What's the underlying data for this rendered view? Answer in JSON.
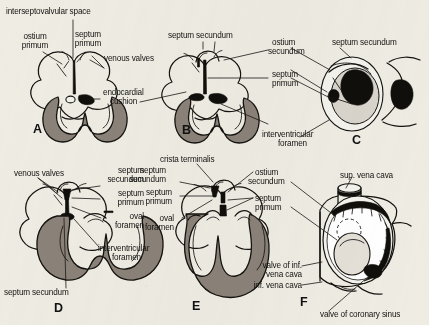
{
  "figure": {
    "background_color": "#efece4",
    "ink_color": "#111111",
    "myocardium_fill": "#8b8279",
    "panels": [
      {
        "letter": "A",
        "labels": [
          "interseptovalvular space",
          "ostium\nprimum",
          "septum\nprimum",
          "venous valves",
          "endocardial\ncushion"
        ]
      },
      {
        "letter": "B",
        "labels": [
          "septum secundum",
          "ostium\nsecundum",
          "septum\nprimum",
          "interventricular\nforamen"
        ]
      },
      {
        "letter": "C",
        "labels": [
          "septum secundum"
        ]
      },
      {
        "letter": "D",
        "labels": [
          "venous valves",
          "septum\nsecundum",
          "septum\nprimum",
          "oval\nforamen",
          "interventricular\nforamen",
          "septum secundum"
        ]
      },
      {
        "letter": "E",
        "labels": [
          "crista terminalis",
          "septum\nsecundum",
          "septum\nprimum",
          "oval\nforamen",
          "interventricular\nforamen",
          "ostium\nsecundum",
          "septum\nprimum"
        ]
      },
      {
        "letter": "F",
        "labels": [
          "sup. vena cava",
          "valve of inf.\nvena cava",
          "inf. vena cava",
          "valve of coronary sinus"
        ]
      }
    ]
  },
  "labels": {
    "interseptovalvular_space": "interseptovalvular space",
    "ostium_primum_l1": "ostium",
    "ostium_primum_l2": "primum",
    "septum_primum_a_l1": "septum",
    "septum_primum_a_l2": "primum",
    "venous_valves_a": "venous valves",
    "endocardial_l1": "endocardial",
    "endocardial_l2": "cushion",
    "letter_a": "A",
    "septum_secundum_b": "septum secundum",
    "ostium_secundum_b_l1": "ostium",
    "ostium_secundum_b_l2": "secundum",
    "septum_primum_b_l1": "septum",
    "septum_primum_b_l2": "primum",
    "interventricular_b_l1": "interventricular",
    "interventricular_b_l2": "foramen",
    "letter_b": "B",
    "septum_secundum_c": "septum secundum",
    "letter_c": "C",
    "venous_valves_d": "venous valves",
    "septum_secundum_d_top_l1": "septum",
    "septum_secundum_d_top_l2": "secundum",
    "septum_primum_d_l1": "septum",
    "septum_primum_d_l2": "primum",
    "oval_foramen_d_l1": "oval",
    "oval_foramen_d_l2": "foramen",
    "interventricular_d_l1": "interventricular",
    "interventricular_d_l2": "foramen",
    "septum_secundum_d_bottom": "septum secundum",
    "letter_d": "D",
    "crista_terminalis_e": "crista terminalis",
    "septum_secundum_e_l1": "septum",
    "septum_secundum_e_l2": "secundum",
    "septum_primum_e_left_l1": "septum",
    "septum_primum_e_left_l2": "primum",
    "oval_foramen_e_l1": "oval",
    "oval_foramen_e_l2": "foramen",
    "ostium_secundum_e_l1": "ostium",
    "ostium_secundum_e_l2": "secundum",
    "septum_primum_e_right_l1": "septum",
    "septum_primum_e_right_l2": "primum",
    "letter_e": "E",
    "sup_vena_cava_f": "sup. vena cava",
    "valve_inf_vc_l1": "valve of inf.",
    "valve_inf_vc_l2": "vena cava",
    "inf_vena_cava_f": "inf. vena cava",
    "valve_coronary_sinus_f": "valve of coronary sinus",
    "letter_f": "F"
  }
}
